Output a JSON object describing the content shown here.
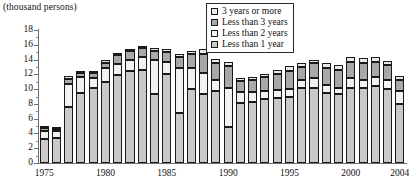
{
  "chart_data": {
    "type": "bar",
    "subtype": "stacked-column",
    "title": "(thousand persons)",
    "xlabel": "",
    "ylabel": "(thousand persons)",
    "ylim": [
      0,
      18
    ],
    "ytick_step": 2,
    "yticks": [
      0,
      2,
      4,
      6,
      8,
      10,
      12,
      14,
      16,
      18
    ],
    "ytick_labels": [
      "0",
      "2",
      "4",
      "6",
      "8",
      "10",
      "12",
      "14",
      "16",
      "18"
    ],
    "grid": false,
    "legend_position": "top-right",
    "categories": [
      "1975",
      "1976",
      "1977",
      "1978",
      "1979",
      "1980",
      "1981",
      "1982",
      "1983",
      "1984",
      "1985",
      "1986",
      "1987",
      "1988",
      "1989",
      "1990",
      "1991",
      "1992",
      "1993",
      "1994",
      "1995",
      "1996",
      "1997",
      "1998",
      "1999",
      "2000",
      "2001",
      "2002",
      "2003",
      "2004"
    ],
    "xtick_labels": [
      {
        "label": "1975",
        "category": "1975"
      },
      {
        "label": "1980",
        "category": "1980"
      },
      {
        "label": "1985",
        "category": "1985"
      },
      {
        "label": "1990",
        "category": "1990"
      },
      {
        "label": "1995",
        "category": "1995"
      },
      {
        "label": "2000",
        "category": "2000"
      },
      {
        "label": "2004",
        "category": "2004"
      }
    ],
    "series": [
      {
        "name": "Less than 1 year",
        "color": "#c9c9c9",
        "values": [
          3.2,
          3.4,
          7.6,
          9.5,
          10.2,
          11.0,
          11.9,
          12.5,
          12.6,
          9.3,
          12.1,
          6.8,
          10.0,
          9.4,
          9.7,
          4.9,
          8.1,
          8.3,
          8.6,
          8.8,
          9.0,
          10.1,
          10.2,
          9.5,
          9.3,
          10.2,
          10.1,
          10.4,
          10.0,
          8.0
        ]
      },
      {
        "name": "Less than 2 years",
        "color": "#f2f2f2",
        "values": [
          1.2,
          0.9,
          3.1,
          2.2,
          1.3,
          1.8,
          1.5,
          1.4,
          1.7,
          4.6,
          1.6,
          6.1,
          2.8,
          2.8,
          1.6,
          5.3,
          1.5,
          1.3,
          1.2,
          1.1,
          1.0,
          1.1,
          1.3,
          1.0,
          0.9,
          1.3,
          1.2,
          1.3,
          1.3,
          1.8
        ]
      },
      {
        "name": "Less than 3 years",
        "color": "#a8a8a8",
        "values": [
          0.4,
          0.3,
          0.7,
          0.5,
          0.7,
          0.8,
          1.2,
          1.2,
          1.2,
          1.2,
          1.3,
          1.5,
          1.9,
          2.6,
          2.3,
          2.9,
          1.5,
          1.7,
          1.8,
          2.2,
          2.5,
          1.8,
          2.0,
          2.4,
          2.4,
          2.2,
          2.3,
          2.0,
          1.9,
          1.5
        ]
      },
      {
        "name": "3 years or more",
        "color": "#e8e8e8",
        "values": [
          0.2,
          0.2,
          0.4,
          0.3,
          0.3,
          0.3,
          0.3,
          0.3,
          0.4,
          0.4,
          0.4,
          0.4,
          0.4,
          0.6,
          0.5,
          0.6,
          0.4,
          0.4,
          0.4,
          0.5,
          0.6,
          0.5,
          0.5,
          0.6,
          0.6,
          0.6,
          0.6,
          0.6,
          0.6,
          0.5
        ]
      }
    ],
    "totals": [
      5.0,
      4.8,
      11.8,
      12.5,
      12.5,
      13.9,
      14.9,
      15.4,
      15.9,
      15.5,
      15.4,
      14.8,
      15.1,
      15.4,
      14.1,
      13.7,
      11.5,
      11.7,
      12.0,
      12.6,
      13.1,
      13.5,
      14.0,
      13.5,
      13.2,
      14.3,
      14.2,
      14.3,
      13.8,
      11.8
    ]
  },
  "legend": {
    "items": [
      {
        "label": "3 years or more",
        "color": "#e8e8e8"
      },
      {
        "label": "Less than 3 years",
        "color": "#a8a8a8"
      },
      {
        "label": "Less than 2 years",
        "color": "#f2f2f2"
      },
      {
        "label": "Less than 1 year",
        "color": "#c9c9c9"
      }
    ]
  }
}
